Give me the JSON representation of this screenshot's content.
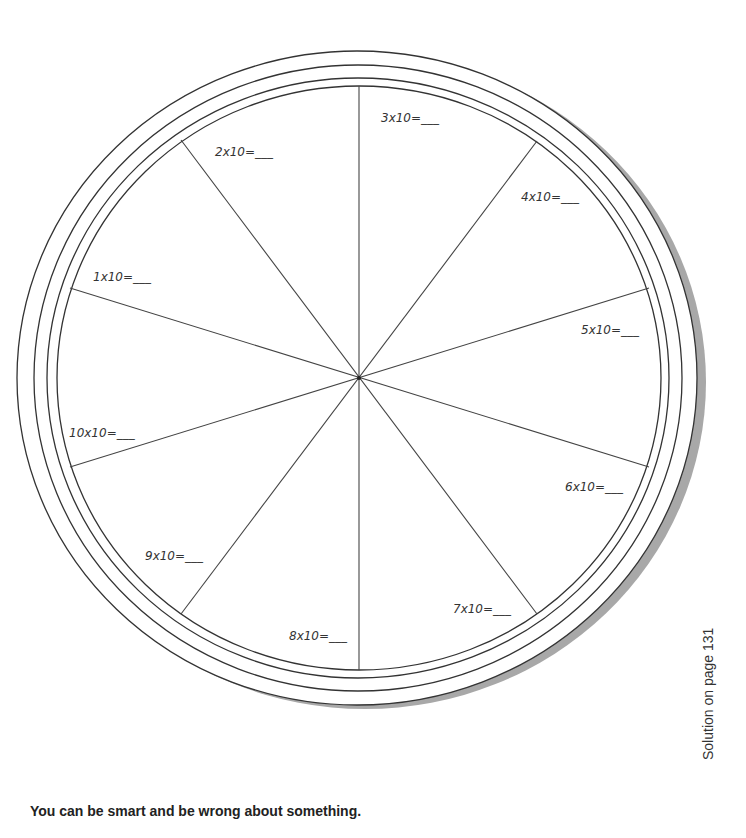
{
  "worksheet": {
    "wheel": {
      "colors": {
        "stroke": "#333333",
        "shadow": "#a8a8a8",
        "label": "#333333"
      },
      "segments": [
        {
          "label": "1x10=___"
        },
        {
          "label": "2x10=___"
        },
        {
          "label": "3x10=___"
        },
        {
          "label": "4x10=___"
        },
        {
          "label": "5x10=___"
        },
        {
          "label": "6x10=___"
        },
        {
          "label": "7x10=___"
        },
        {
          "label": "8x10=___"
        },
        {
          "label": "9x10=___"
        },
        {
          "label": "10x10=___"
        }
      ]
    },
    "caption": "You can be smart and be wrong about something.",
    "side_note": "Solution on page 131"
  }
}
